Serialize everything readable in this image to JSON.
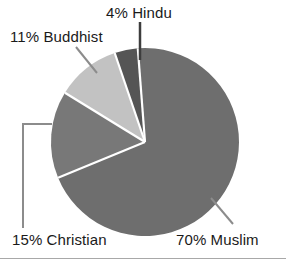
{
  "chart_data": {
    "type": "pie",
    "title": "",
    "categories": [
      "Muslim",
      "Christian",
      "Buddhist",
      "Hindu"
    ],
    "values": [
      70,
      15,
      11,
      4
    ],
    "labels": [
      "70% Muslim",
      "15% Christian",
      "11% Buddhist",
      "4% Hindu"
    ],
    "colors": [
      "#6e6e6e",
      "#787878",
      "#c2c2c2",
      "#555555"
    ],
    "unit": "%",
    "legend": "none",
    "grid": false,
    "xlabel": "",
    "ylabel": "",
    "annotations": [
      "Leader line from 4% Hindu label down to Hindu wedge",
      "Leader line from 11% Buddhist label to Buddhist wedge",
      "L-shaped leader line from 15% Christian label to Christian wedge",
      "Leader line from 70% Muslim label to Muslim wedge"
    ]
  },
  "labels": {
    "hindu": "4% Hindu",
    "buddhist": "11% Buddhist",
    "christian": "15% Christian",
    "muslim": "70% Muslim"
  },
  "colors": {
    "muslim": "#6e6e6e",
    "christian": "#787878",
    "buddhist": "#c2c2c2",
    "hindu": "#555555",
    "separator": "#ffffff",
    "leader": "#8c8c8c",
    "leader_dark": "#3d3d3d",
    "text": "#1a1a1a",
    "rule": "#a8a8a8",
    "background": "#ffffff"
  }
}
